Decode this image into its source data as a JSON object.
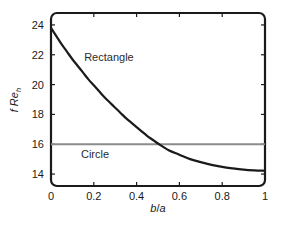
{
  "chart_data": {
    "type": "line",
    "title": "",
    "xlabel": "b/a",
    "ylabel": "f Re_h",
    "ylabel_main": "f  Re",
    "ylabel_sub": "h",
    "xlabel_num": "b",
    "xlabel_slash": "/",
    "xlabel_den": "a",
    "xlim": [
      0,
      1
    ],
    "ylim": [
      13.2,
      24.8
    ],
    "grid": false,
    "legend": "inline-annotations",
    "xticks": [
      0,
      0.2,
      0.4,
      0.6,
      0.8,
      1
    ],
    "xticklabels": [
      "0",
      "0.2",
      "0.4",
      "0.6",
      "0.8",
      "1"
    ],
    "yticks": [
      14,
      16,
      18,
      20,
      22,
      24
    ],
    "yticklabels": [
      "14",
      "16",
      "18",
      "20",
      "22",
      "24"
    ],
    "series": [
      {
        "name": "Rectangle",
        "color": "#1a1a1a",
        "linewidth": 2.2,
        "annotation": "Rectangle",
        "x": [
          0,
          0.025,
          0.05,
          0.075,
          0.1,
          0.125,
          0.15,
          0.175,
          0.2,
          0.225,
          0.25,
          0.275,
          0.3,
          0.325,
          0.35,
          0.375,
          0.4,
          0.425,
          0.45,
          0.475,
          0.5,
          0.55,
          0.6,
          0.65,
          0.7,
          0.75,
          0.8,
          0.85,
          0.9,
          0.95,
          1
        ],
        "values": [
          23.8,
          23.25,
          22.7,
          22.2,
          21.7,
          21.25,
          20.8,
          20.35,
          19.95,
          19.55,
          19.15,
          18.8,
          18.45,
          18.1,
          17.75,
          17.45,
          17.15,
          16.85,
          16.55,
          16.3,
          16.05,
          15.6,
          15.3,
          15.0,
          14.8,
          14.62,
          14.48,
          14.38,
          14.3,
          14.25,
          14.22
        ]
      },
      {
        "name": "Circle",
        "color": "#8c8c8c",
        "linewidth": 2.0,
        "annotation": "Circle",
        "constant_value": 16,
        "x": [
          0,
          1
        ],
        "values": [
          16,
          16
        ]
      }
    ],
    "annotations": [
      {
        "text": "Rectangle",
        "x": 0.155,
        "y": 21.55
      },
      {
        "text": "Circle",
        "x": 0.14,
        "y": 15.1
      }
    ]
  },
  "axes": {
    "frame_color": "#1a1a1a",
    "background": "#ffffff"
  }
}
